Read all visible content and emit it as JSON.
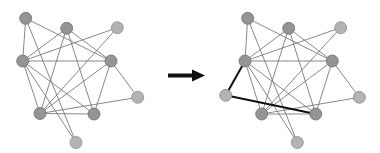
{
  "diagram": {
    "arrow": {
      "color": "#111111",
      "from": [
        168,
        75.5
      ],
      "to": [
        205,
        75.5
      ]
    },
    "colors": {
      "edge": "#7a7a7a",
      "new_edge": "#111111",
      "node_dark": "#949494",
      "node_light": "#b3b3b3"
    },
    "node_radius": 6,
    "before": {
      "nodes": [
        {
          "id": "A",
          "x": 25.7,
          "y": 18.3,
          "shade": "dark"
        },
        {
          "id": "B",
          "x": 66.7,
          "y": 28.3,
          "shade": "dark"
        },
        {
          "id": "C",
          "x": 117.3,
          "y": 27.7,
          "shade": "light"
        },
        {
          "id": "D",
          "x": 22.7,
          "y": 61,
          "shade": "dark"
        },
        {
          "id": "E",
          "x": 111,
          "y": 61,
          "shade": "dark"
        },
        {
          "id": "F",
          "x": 137.7,
          "y": 97.3,
          "shade": "light"
        },
        {
          "id": "G",
          "x": 40,
          "y": 113.5,
          "shade": "dark"
        },
        {
          "id": "H",
          "x": 94,
          "y": 114,
          "shade": "dark"
        },
        {
          "id": "I",
          "x": 76,
          "y": 142.5,
          "shade": "light"
        }
      ],
      "edges": [
        [
          "A",
          "D"
        ],
        [
          "A",
          "E"
        ],
        [
          "A",
          "I"
        ],
        [
          "B",
          "D"
        ],
        [
          "B",
          "E"
        ],
        [
          "B",
          "G"
        ],
        [
          "B",
          "H"
        ],
        [
          "C",
          "D"
        ],
        [
          "C",
          "G"
        ],
        [
          "D",
          "E"
        ],
        [
          "D",
          "G"
        ],
        [
          "D",
          "H"
        ],
        [
          "D",
          "I"
        ],
        [
          "E",
          "F"
        ],
        [
          "E",
          "G"
        ],
        [
          "E",
          "H"
        ],
        [
          "F",
          "G"
        ],
        [
          "G",
          "H"
        ]
      ]
    },
    "after": {
      "nodes": [
        {
          "id": "A",
          "x": 247.7,
          "y": 18.3,
          "shade": "dark"
        },
        {
          "id": "B",
          "x": 288.7,
          "y": 28.3,
          "shade": "dark"
        },
        {
          "id": "C",
          "x": 340.7,
          "y": 27.7,
          "shade": "light"
        },
        {
          "id": "D",
          "x": 245,
          "y": 61,
          "shade": "dark"
        },
        {
          "id": "E",
          "x": 332.3,
          "y": 61,
          "shade": "dark"
        },
        {
          "id": "F",
          "x": 359.3,
          "y": 97.3,
          "shade": "light"
        },
        {
          "id": "J",
          "x": 225.7,
          "y": 95.3,
          "shade": "light",
          "new": true
        },
        {
          "id": "G",
          "x": 261.7,
          "y": 114,
          "shade": "dark"
        },
        {
          "id": "H",
          "x": 315.7,
          "y": 114,
          "shade": "dark"
        },
        {
          "id": "I",
          "x": 297.3,
          "y": 142.5,
          "shade": "light"
        }
      ],
      "edges": [
        [
          "A",
          "D"
        ],
        [
          "A",
          "E"
        ],
        [
          "A",
          "I"
        ],
        [
          "B",
          "D"
        ],
        [
          "B",
          "E"
        ],
        [
          "B",
          "G"
        ],
        [
          "B",
          "H"
        ],
        [
          "C",
          "D"
        ],
        [
          "C",
          "G"
        ],
        [
          "D",
          "E"
        ],
        [
          "D",
          "G"
        ],
        [
          "D",
          "H"
        ],
        [
          "D",
          "I"
        ],
        [
          "E",
          "F"
        ],
        [
          "E",
          "G"
        ],
        [
          "E",
          "H"
        ],
        [
          "F",
          "G"
        ],
        [
          "G",
          "H"
        ]
      ],
      "new_edges": [
        [
          "J",
          "D"
        ],
        [
          "J",
          "H"
        ]
      ]
    }
  }
}
